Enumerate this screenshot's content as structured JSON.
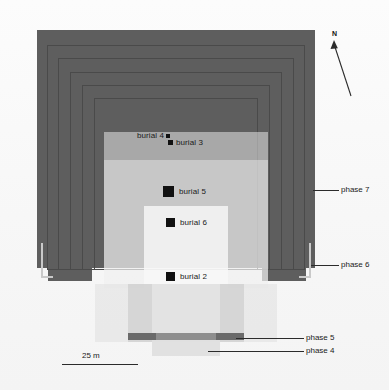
{
  "figure": {
    "type": "archaeological-site-plan"
  },
  "burials": [
    {
      "id": "burial-4",
      "label": "burial 4",
      "marker_size": "tiny",
      "x": 137,
      "y": 131
    },
    {
      "id": "burial-3",
      "label": "burial 3",
      "marker_size": "tiny",
      "x": 168,
      "y": 138
    },
    {
      "id": "burial-5",
      "label": "burial 5",
      "marker_size": "large",
      "x": 163,
      "y": 186
    },
    {
      "id": "burial-6",
      "label": "burial 6",
      "marker_size": "medium",
      "x": 166,
      "y": 218
    },
    {
      "id": "burial-2",
      "label": "burial 2",
      "marker_size": "medium",
      "x": 166,
      "y": 272
    }
  ],
  "phases": [
    {
      "id": "phase-7",
      "label": "phase 7",
      "tone": "#5e5e5e"
    },
    {
      "id": "phase-6",
      "label": "phase 6",
      "tone": "#c9c9c9"
    },
    {
      "id": "phase-5",
      "label": "phase 5",
      "tone": "#6a6a6a"
    },
    {
      "id": "phase-4",
      "label": "phase 4",
      "tone": "#e2e2e2"
    }
  ],
  "north_arrow": {
    "label": "N",
    "icon": "north-arrow-icon",
    "bearing_description": "points up and slightly left"
  },
  "scale": {
    "label": "25 m",
    "bar_length_px": 76
  },
  "colors": {
    "background": "#fbfbfb",
    "phase7_fill": "#5e5e5e",
    "outline": "#4a4a4a",
    "bracket": "#c9c9c9",
    "marker": "#111111",
    "text": "#1a1a1a"
  }
}
